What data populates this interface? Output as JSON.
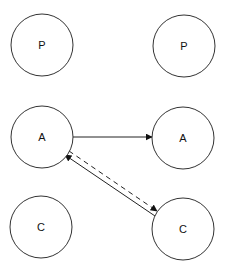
{
  "diagram": {
    "width": 226,
    "height": 266,
    "colors": {
      "stroke": "#333333",
      "text": "#111111",
      "background": "#ffffff"
    },
    "nodes": [
      {
        "id": "p-left",
        "label": "P",
        "cx": 42,
        "cy": 45,
        "r": 31
      },
      {
        "id": "p-right",
        "label": "P",
        "cx": 184,
        "cy": 46,
        "r": 31
      },
      {
        "id": "a-left",
        "label": "A",
        "cx": 42,
        "cy": 137,
        "r": 31
      },
      {
        "id": "a-right",
        "label": "A",
        "cx": 183,
        "cy": 138,
        "r": 31
      },
      {
        "id": "c-left",
        "label": "C",
        "cx": 41,
        "cy": 227,
        "r": 31
      },
      {
        "id": "c-right",
        "label": "C",
        "cx": 183,
        "cy": 229,
        "r": 31
      }
    ],
    "edges": [
      {
        "id": "a-left-to-a-right",
        "from": "a-left",
        "to": "a-right",
        "style": "solid",
        "x1": 73,
        "y1": 137,
        "x2": 152,
        "y2": 137
      },
      {
        "id": "a-left-to-c-right",
        "from": "a-left",
        "to": "c-right",
        "style": "dashed",
        "x1": 69,
        "y1": 151,
        "x2": 157,
        "y2": 211
      },
      {
        "id": "c-right-to-a-left",
        "from": "c-right",
        "to": "a-left",
        "style": "solid",
        "x1": 155,
        "y1": 216,
        "x2": 65,
        "y2": 155
      }
    ]
  }
}
